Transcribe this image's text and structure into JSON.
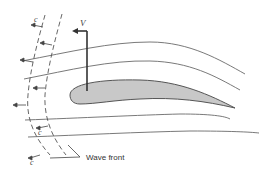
{
  "figure": {
    "labels": {
      "velocity": "V",
      "wave_speed": "c",
      "wave_front": "Wave front"
    },
    "colors": {
      "line": "#555555",
      "airfoil_fill": "#c8c8c8",
      "airfoil_stroke": "#555555",
      "background": "#ffffff"
    }
  }
}
